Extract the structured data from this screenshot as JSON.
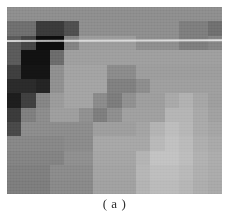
{
  "figure": {
    "caption": "( a )",
    "panel_label": "a",
    "image_kind": "pixelated-grayscale-mosaic",
    "background_color": "#ffffff",
    "image_bounds": {
      "x": 7,
      "y": 7,
      "width": 215,
      "height": 187
    },
    "artifact": {
      "name": "horizontal-bright-scanline",
      "y": 40,
      "color": "#ffffff"
    }
  },
  "chart_data": {
    "type": "heatmap",
    "title": "",
    "subtitle": "",
    "xlabel": "",
    "ylabel": "",
    "grid": false,
    "legend": false,
    "colormap": "grayscale",
    "value_range": [
      0,
      255
    ],
    "note": "Blocky / mosaic-censored grayscale image. Values are 8-bit gray levels per block, read left-to-right, top-to-bottom.",
    "cols": 15,
    "rows": 13,
    "cell_width": 14.33,
    "cell_height": 14.38,
    "colors": [
      [
        "#8d8d8d",
        "#8d8d8d",
        "#8d8d8d",
        "#8d8d8d",
        "#8d8d8d",
        "#8d8d8d",
        "#8d8d8d",
        "#8d8d8d",
        "#8d8d8d",
        "#8d8d8d",
        "#8d8d8d",
        "#8d8d8d",
        "#8d8d8d",
        "#8d8d8d",
        "#8d8d8d"
      ],
      [
        "#6e6e6e",
        "#6e6e6e",
        "#3a3a3a",
        "#3a3a3a",
        "#4e4e4e",
        "#8d8d8d",
        "#8d8d8d",
        "#8d8d8d",
        "#8d8d8d",
        "#8d8d8d",
        "#8d8d8d",
        "#8d8d8d",
        "#7d7d7d",
        "#7d7d7d",
        "#6f6f6f"
      ],
      [
        "#5a5a5a",
        "#454545",
        "#0d0d0d",
        "#0d0d0d",
        "#828282",
        "#9b9b9b",
        "#9b9b9b",
        "#9b9b9b",
        "#9b9b9b",
        "#8d8d8d",
        "#8d8d8d",
        "#8d8d8d",
        "#7d7d7d",
        "#7d7d7d",
        "#848484"
      ],
      [
        "#5a5a5a",
        "#111111",
        "#111111",
        "#6b6b6b",
        "#9e9e9e",
        "#9e9e9e",
        "#9e9e9e",
        "#9e9e9e",
        "#9e9e9e",
        "#9e9e9e",
        "#9e9e9e",
        "#9e9e9e",
        "#9e9e9e",
        "#9e9e9e",
        "#9e9e9e"
      ],
      [
        "#3e3e3e",
        "#141414",
        "#141414",
        "#8e8e8e",
        "#a2a2a2",
        "#a2a2a2",
        "#a2a2a2",
        "#8a8a8a",
        "#8a8a8a",
        "#9c9c9c",
        "#9c9c9c",
        "#9c9c9c",
        "#9c9c9c",
        "#9c9c9c",
        "#9c9c9c"
      ],
      [
        "#2a2a2a",
        "#2a2a2a",
        "#232323",
        "#8f8f8f",
        "#a3a3a3",
        "#a3a3a3",
        "#a3a3a3",
        "#7f7f7f",
        "#7f7f7f",
        "#8c8c8c",
        "#9e9e9e",
        "#9e9e9e",
        "#9e9e9e",
        "#9e9e9e",
        "#9e9e9e"
      ],
      [
        "#1d1d1d",
        "#3f3f3f",
        "#848484",
        "#9a9a9a",
        "#a3a3a3",
        "#a3a3a3",
        "#8a8a8a",
        "#7b7b7b",
        "#8f8f8f",
        "#9d9d9d",
        "#9d9d9d",
        "#a8a8a8",
        "#b0b0b0",
        "#a5a5a5",
        "#9d9d9d"
      ],
      [
        "#3a3a3a",
        "#7e7e7e",
        "#8b8b8b",
        "#9d9d9d",
        "#9d9d9d",
        "#8f8f8f",
        "#7d7d7d",
        "#8d8d8d",
        "#9f9f9f",
        "#9f9f9f",
        "#9f9f9f",
        "#b4b4b4",
        "#b4b4b4",
        "#a8a8a8",
        "#a0a0a0"
      ],
      [
        "#484848",
        "#8b8b8b",
        "#8b8b8b",
        "#8b8b8b",
        "#8b8b8b",
        "#8b8b8b",
        "#9d9d9d",
        "#9d9d9d",
        "#9d9d9d",
        "#a3a3a3",
        "#b2b2b2",
        "#bcbcbc",
        "#b6b6b6",
        "#a9a9a9",
        "#a4a4a4"
      ],
      [
        "#868686",
        "#868686",
        "#868686",
        "#868686",
        "#8a8a8a",
        "#8a8a8a",
        "#a6a6a6",
        "#a6a6a6",
        "#a6a6a6",
        "#a6a6a6",
        "#b8b8b8",
        "#c0c0c0",
        "#bababa",
        "#adadad",
        "#a8a8a8"
      ],
      [
        "#828282",
        "#828282",
        "#828282",
        "#828282",
        "#8e8e8e",
        "#8e8e8e",
        "#a4a4a4",
        "#a4a4a4",
        "#a4a4a4",
        "#b3b3b3",
        "#c2c2c2",
        "#c2c2c2",
        "#bcbcbc",
        "#b0b0b0",
        "#ababab"
      ],
      [
        "#7e7e7e",
        "#7e7e7e",
        "#7e7e7e",
        "#8a8a8a",
        "#8a8a8a",
        "#8a8a8a",
        "#a2a2a2",
        "#a2a2a2",
        "#a2a2a2",
        "#b5b5b5",
        "#bdbdbd",
        "#bdbdbd",
        "#b8b8b8",
        "#aeaeae",
        "#aaaaaa"
      ],
      [
        "#7c7c7c",
        "#7c7c7c",
        "#7c7c7c",
        "#888888",
        "#888888",
        "#888888",
        "#a0a0a0",
        "#a0a0a0",
        "#a0a0a0",
        "#b2b2b2",
        "#bababa",
        "#bababa",
        "#b5b5b5",
        "#acacac",
        "#a8a8a8"
      ]
    ],
    "values": [
      [
        141,
        141,
        141,
        141,
        141,
        141,
        141,
        141,
        141,
        141,
        141,
        141,
        141,
        141,
        141
      ],
      [
        110,
        110,
        58,
        58,
        78,
        141,
        141,
        141,
        141,
        141,
        141,
        141,
        125,
        125,
        111
      ],
      [
        90,
        69,
        13,
        13,
        130,
        155,
        155,
        155,
        155,
        141,
        141,
        141,
        125,
        125,
        132
      ],
      [
        90,
        17,
        17,
        107,
        158,
        158,
        158,
        158,
        158,
        158,
        158,
        158,
        158,
        158,
        158
      ],
      [
        62,
        20,
        20,
        142,
        162,
        162,
        162,
        138,
        138,
        156,
        156,
        156,
        156,
        156,
        156
      ],
      [
        42,
        42,
        35,
        143,
        163,
        163,
        163,
        127,
        127,
        140,
        158,
        158,
        158,
        158,
        158
      ],
      [
        29,
        63,
        132,
        154,
        163,
        163,
        138,
        123,
        143,
        157,
        157,
        168,
        176,
        165,
        157
      ],
      [
        58,
        126,
        139,
        157,
        157,
        143,
        125,
        141,
        159,
        159,
        159,
        180,
        180,
        168,
        160
      ],
      [
        72,
        139,
        139,
        139,
        139,
        139,
        157,
        157,
        157,
        163,
        178,
        188,
        182,
        169,
        164
      ],
      [
        134,
        134,
        134,
        134,
        138,
        138,
        166,
        166,
        166,
        166,
        184,
        192,
        186,
        173,
        168
      ],
      [
        130,
        130,
        130,
        130,
        142,
        142,
        164,
        164,
        164,
        179,
        194,
        194,
        188,
        176,
        171
      ],
      [
        126,
        126,
        126,
        138,
        138,
        138,
        162,
        162,
        162,
        181,
        189,
        189,
        184,
        174,
        170
      ],
      [
        124,
        124,
        124,
        136,
        136,
        136,
        160,
        160,
        160,
        178,
        186,
        186,
        181,
        172,
        168
      ]
    ]
  }
}
